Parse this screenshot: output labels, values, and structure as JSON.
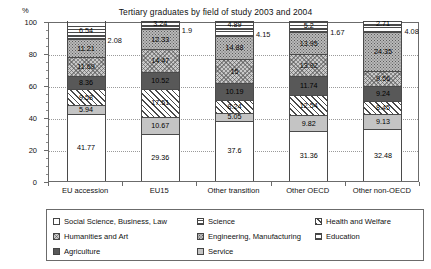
{
  "chart_data": {
    "type": "bar",
    "subtype": "stacked-percent-column",
    "title": "Tertiary graduates by field of study 2003 and 2004",
    "xlabel": "",
    "ylabel": "%",
    "ylim": [
      0,
      100
    ],
    "yticks": [
      0,
      20,
      40,
      60,
      80,
      100
    ],
    "grid": true,
    "legend_position": "bottom",
    "categories": [
      "EU accession",
      "EU15",
      "Other transition",
      "Other OECD",
      "Other non-OECD"
    ],
    "series": [
      {
        "name": "Social Science, Business, Law",
        "pattern": "plain-white",
        "values": [
          41.77,
          29.36,
          37.6,
          31.36,
          32.48
        ]
      },
      {
        "name": "Service",
        "pattern": "light-grey",
        "values": [
          5.94,
          10.67,
          5.05,
          9.82,
          9.13
        ]
      },
      {
        "name": "Health and Welfare",
        "pattern": "diagonal-hatch",
        "values": [
          9.58,
          17.51,
          8.24,
          12.54,
          8.45
        ]
      },
      {
        "name": "Agriculture",
        "pattern": "solid-dark",
        "values": [
          8.36,
          10.52,
          10.19,
          11.74,
          9.24
        ]
      },
      {
        "name": "Humanities and Art",
        "pattern": "cross-hatch",
        "values": [
          11.69,
          14.47,
          15,
          13.92,
          9.56
        ]
      },
      {
        "name": "Engineering, Manufacturing",
        "pattern": "speckle",
        "values": [
          11.21,
          12.33,
          14.88,
          13.95,
          24.35
        ]
      },
      {
        "name": "Education",
        "pattern": "horizontal-bands",
        "values": [
          2.08,
          1.9,
          4.15,
          1.67,
          4.08
        ]
      },
      {
        "name": "Science",
        "pattern": "horizontal-lines",
        "values": [
          6.54,
          3.24,
          4.89,
          5.2,
          2.71
        ]
      }
    ],
    "outside_labels": [
      "2.08",
      "1.9",
      "4.15",
      "1.67",
      "4.08"
    ]
  },
  "axis": {
    "unit": "%",
    "y_ticks": [
      "100",
      "80",
      "60",
      "40",
      "20",
      "0"
    ]
  },
  "legend": {
    "columns": [
      [
        {
          "label": "Social Science, Business, Law",
          "pattern": "plain-white"
        },
        {
          "label": "Humanities and Art",
          "pattern": "cross-hatch"
        },
        {
          "label": "Agriculture",
          "pattern": "solid-dark"
        }
      ],
      [
        {
          "label": "Science",
          "pattern": "horizontal-lines"
        },
        {
          "label": "Engineering, Manufacturing",
          "pattern": "speckle"
        },
        {
          "label": "Service",
          "pattern": "light-grey"
        }
      ],
      [
        {
          "label": "Health and Welfare",
          "pattern": "diagonal-hatch"
        },
        {
          "label": "Education",
          "pattern": "horizontal-bands"
        }
      ]
    ]
  }
}
